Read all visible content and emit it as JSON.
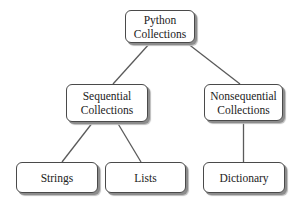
{
  "diagram": {
    "nodes": {
      "root": {
        "line1": "Python",
        "line2": "Collections"
      },
      "sequential": {
        "line1": "Sequential",
        "line2": "Collections"
      },
      "nonsequential": {
        "line1": "Nonsequential",
        "line2": "Collections"
      },
      "strings": {
        "label": "Strings"
      },
      "lists": {
        "label": "Lists"
      },
      "dictionary": {
        "label": "Dictionary"
      }
    },
    "edges": [
      {
        "from": "root",
        "to": "sequential"
      },
      {
        "from": "root",
        "to": "nonsequential"
      },
      {
        "from": "sequential",
        "to": "strings"
      },
      {
        "from": "sequential",
        "to": "lists"
      },
      {
        "from": "nonsequential",
        "to": "dictionary"
      }
    ],
    "colors": {
      "border": "#4a4a4a",
      "shadow": "#8c8c8c",
      "connector": "#5a5a5a",
      "text": "#222222",
      "background": "#ffffff"
    }
  }
}
